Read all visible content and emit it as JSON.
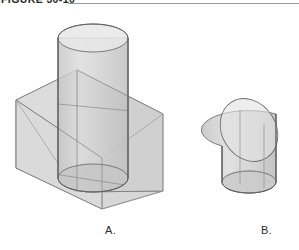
{
  "header": {
    "label": "FIGURE 30-10",
    "rule_color": "#9a9a9a"
  },
  "panels": [
    {
      "id": "panel-a",
      "caption": "A.",
      "description": "Cylinder passing through a slanted rectangular wedge / prism"
    },
    {
      "id": "panel-b",
      "caption": "B.",
      "description": "Cylinder truncated by an oblique plane, producing an elliptical cut"
    }
  ],
  "style": {
    "background": "#ffffff",
    "line_color": "#6e6e6e",
    "line_color_light": "#9b9b9b",
    "fill_light": "#e2e2e2",
    "fill_mid": "#d2d2d2",
    "fill_dark": "#c2c2c2",
    "fill_cylinder": "#cfcfcf",
    "caption_color": "#2b2b2b"
  }
}
